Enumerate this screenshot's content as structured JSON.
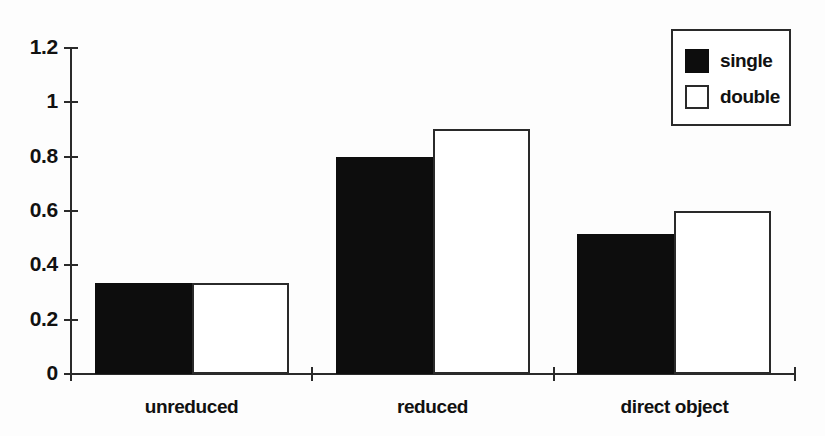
{
  "chart_data": {
    "type": "bar",
    "title": "",
    "xlabel": "",
    "ylabel": "",
    "ylim": [
      0,
      1.2
    ],
    "grid": false,
    "legend_position": "top-right",
    "categories": [
      "unreduced",
      "reduced",
      "direct object"
    ],
    "yticks": [
      "0",
      "0.2",
      "0.4",
      "0.6",
      "0.8",
      "1",
      "1.2"
    ],
    "ytick_values": [
      0,
      0.2,
      0.4,
      0.6,
      0.8,
      1,
      1.2
    ],
    "series": [
      {
        "name": "single",
        "color": "#0d0d0d",
        "values": [
          0.335,
          0.8,
          0.515
        ]
      },
      {
        "name": "double",
        "color": "#ffffff",
        "values": [
          0.335,
          0.9,
          0.6
        ]
      }
    ]
  },
  "legend": {
    "items": [
      {
        "label": "single",
        "style": "filled"
      },
      {
        "label": "double",
        "style": "outlined"
      }
    ]
  },
  "colors": {
    "axis": "#2a2a2a",
    "single_fill": "#0d0d0d",
    "double_fill": "#ffffff",
    "background": "#fdfdfd"
  }
}
